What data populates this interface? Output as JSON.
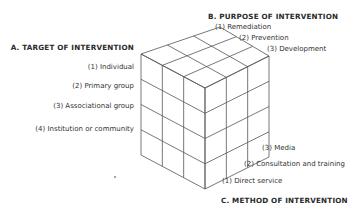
{
  "diagram": {
    "axes": {
      "target": {
        "title": "A. TARGET OF INTERVENTION",
        "items": [
          "(1) Individual",
          "(2) Primary group",
          "(3) Associational group",
          "(4) Institution or community"
        ]
      },
      "purpose": {
        "title": "B. PURPOSE OF INTERVENTION",
        "items": [
          "(1) Remediation",
          "(2) Prevention",
          "(3) Development"
        ]
      },
      "method": {
        "title": "C. METHOD OF INTERVENTION",
        "items": [
          "(1) Direct service",
          "(2) Consultation and training",
          "(3) Media"
        ]
      }
    },
    "cube": {
      "divisions": {
        "target": 4,
        "purpose": 3,
        "method": 3
      },
      "line_color": "#555555"
    }
  }
}
